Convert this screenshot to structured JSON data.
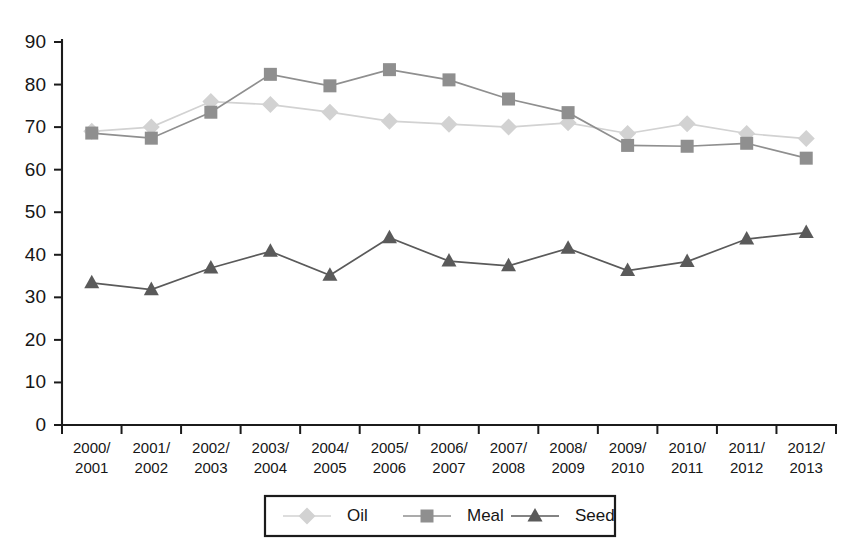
{
  "chart_data": {
    "type": "line",
    "title": "",
    "xlabel": "",
    "ylabel": "",
    "ylim": [
      0,
      90
    ],
    "ytick_step": 10,
    "grid": false,
    "legend_position": "bottom",
    "categories": [
      "2000/\n2001",
      "2001/\n2002",
      "2002/\n2003",
      "2003/\n2004",
      "2004/\n2005",
      "2005/\n2006",
      "2006/\n2007",
      "2007/\n2008",
      "2008/\n2009",
      "2009/\n2010",
      "2010/\n2011",
      "2011/\n2012",
      "2012/\n2013"
    ],
    "categories_line1": [
      "2000/",
      "2001/",
      "2002/",
      "2003/",
      "2004/",
      "2005/",
      "2006/",
      "2007/",
      "2008/",
      "2009/",
      "2010/",
      "2011/",
      "2012/"
    ],
    "categories_line2": [
      "2001",
      "2002",
      "2003",
      "2004",
      "2005",
      "2006",
      "2007",
      "2008",
      "2009",
      "2010",
      "2011",
      "2012",
      "2013"
    ],
    "yticks": [
      0,
      10,
      20,
      30,
      40,
      50,
      60,
      70,
      80,
      90
    ],
    "series": [
      {
        "name": "Oil",
        "marker": "diamond",
        "color": "#d2d2d2",
        "values": [
          69.0,
          70.0,
          76.0,
          75.3,
          73.5,
          71.4,
          70.7,
          70.0,
          71.0,
          68.5,
          70.8,
          68.5,
          67.3
        ]
      },
      {
        "name": "Meal",
        "marker": "square",
        "color": "#8f8f8f",
        "values": [
          68.6,
          67.4,
          73.5,
          82.4,
          79.7,
          83.5,
          81.1,
          76.6,
          73.4,
          65.7,
          65.5,
          66.2,
          62.7
        ]
      },
      {
        "name": "Seed",
        "marker": "triangle",
        "color": "#5a5a5a",
        "values": [
          33.4,
          31.8,
          36.9,
          40.8,
          35.2,
          44.0,
          38.5,
          37.4,
          41.5,
          36.3,
          38.4,
          43.7,
          45.2
        ]
      }
    ]
  },
  "legend": {
    "items": [
      {
        "label": "Oil"
      },
      {
        "label": "Meal"
      },
      {
        "label": "Seed"
      }
    ]
  },
  "axis": {
    "color": "#1b1b1b"
  }
}
